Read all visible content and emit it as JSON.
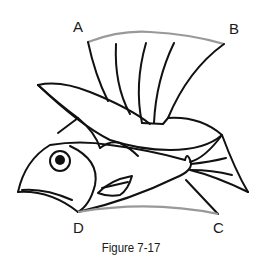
{
  "figure": {
    "caption": "Figure 7-17",
    "points": {
      "A": "A",
      "B": "B",
      "C": "C",
      "D": "D"
    },
    "colors": {
      "outline": "#111111",
      "reference_arc": "#999999",
      "background": "#ffffff"
    }
  }
}
